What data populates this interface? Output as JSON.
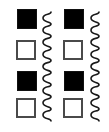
{
  "diagram": {
    "columns": [
      {
        "squares": [
          {
            "state": "filled",
            "x": 17,
            "y": 9
          },
          {
            "state": "empty",
            "x": 16,
            "y": 40
          },
          {
            "state": "filled",
            "x": 17,
            "y": 71
          },
          {
            "state": "empty",
            "x": 16,
            "y": 98
          }
        ],
        "wave": {
          "x_center": 47,
          "y_start": 12,
          "y_end": 121,
          "amplitude": 4,
          "cycles": 9
        }
      },
      {
        "squares": [
          {
            "state": "filled",
            "x": 64,
            "y": 9
          },
          {
            "state": "empty",
            "x": 63,
            "y": 40
          },
          {
            "state": "filled",
            "x": 64,
            "y": 71
          },
          {
            "state": "empty",
            "x": 63,
            "y": 98
          }
        ],
        "wave": {
          "x_center": 95,
          "y_start": 12,
          "y_end": 121,
          "amplitude": 4,
          "cycles": 9
        }
      }
    ],
    "colors": {
      "filled": "#000000",
      "outline": "#4a4a4a",
      "wave": "#1a1a1a",
      "background": "#ffffff"
    }
  }
}
